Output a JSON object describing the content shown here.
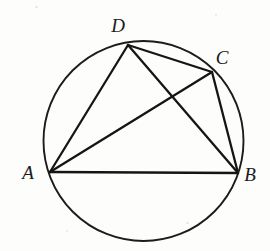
{
  "figure": {
    "background_color": "#fdfdfc",
    "stroke_color": "#151515",
    "circle_stroke_color": "#1c1c1c"
  },
  "circle": {
    "label": "circumscribed-circle",
    "cx": 143.5,
    "cy": 141,
    "r": 100,
    "stroke_width": 1.9
  },
  "vertices": [
    {
      "id": "A",
      "label": "A",
      "x": 50,
      "y": 172,
      "label_x": 28,
      "label_y": 179
    },
    {
      "id": "B",
      "label": "B",
      "x": 238,
      "y": 173,
      "label_x": 250,
      "label_y": 181
    },
    {
      "id": "C",
      "label": "C",
      "x": 212,
      "y": 72,
      "label_x": 222,
      "label_y": 64
    },
    {
      "id": "D",
      "label": "D",
      "x": 128,
      "y": 45,
      "label_x": 118,
      "label_y": 32
    }
  ],
  "chords": [
    {
      "id": "AD",
      "from": "A",
      "to": "D",
      "x1": 50,
      "y1": 172,
      "x2": 128,
      "y2": 45,
      "kind": "side"
    },
    {
      "id": "DC",
      "from": "D",
      "to": "C",
      "x1": 128,
      "y1": 45,
      "x2": 212,
      "y2": 72,
      "kind": "side"
    },
    {
      "id": "CB",
      "from": "C",
      "to": "B",
      "x1": 212,
      "y1": 72,
      "x2": 238,
      "y2": 173,
      "kind": "side"
    },
    {
      "id": "AB",
      "from": "A",
      "to": "B",
      "x1": 50,
      "y1": 172,
      "x2": 238,
      "y2": 173,
      "kind": "side"
    },
    {
      "id": "AC",
      "from": "A",
      "to": "C",
      "x1": 50,
      "y1": 172,
      "x2": 212,
      "y2": 72,
      "kind": "diagonal"
    },
    {
      "id": "DB",
      "from": "D",
      "to": "B",
      "x1": 128,
      "y1": 45,
      "x2": 238,
      "y2": 173,
      "kind": "diagonal"
    }
  ],
  "intersection": {
    "label": "diagonal-intersection",
    "x": 170,
    "y": 116
  }
}
